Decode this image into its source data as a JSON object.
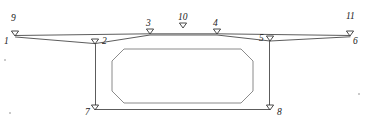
{
  "figure": {
    "type": "line-diagram",
    "title": "",
    "background_color": "#ffffff",
    "line_color": "#4a4a4a",
    "label_color": "#1a1a1a",
    "marker_shape": "down-triangle-outline",
    "width": 366,
    "height": 126
  },
  "nodes": [
    {
      "id": "1",
      "label": "1",
      "x": 15,
      "y": 36,
      "marker": true,
      "label_x": 4,
      "label_y": 37
    },
    {
      "id": "2",
      "label": "2",
      "x": 95,
      "y": 44,
      "marker": true,
      "label_x": 102,
      "label_y": 37
    },
    {
      "id": "3",
      "label": "3",
      "x": 150,
      "y": 34,
      "marker": true,
      "label_x": 146,
      "label_y": 19
    },
    {
      "id": "4",
      "label": "4",
      "x": 217,
      "y": 34,
      "marker": true,
      "label_x": 213,
      "label_y": 19
    },
    {
      "id": "5",
      "label": "5",
      "x": 270,
      "y": 41,
      "marker": true,
      "label_x": 259,
      "label_y": 34
    },
    {
      "id": "6",
      "label": "6",
      "x": 350,
      "y": 36,
      "marker": true,
      "label_x": 353,
      "label_y": 37
    },
    {
      "id": "7",
      "label": "7",
      "x": 95,
      "y": 110,
      "marker": true,
      "label_x": 85,
      "label_y": 108
    },
    {
      "id": "8",
      "label": "8",
      "x": 270,
      "y": 110,
      "marker": true,
      "label_x": 277,
      "label_y": 108
    },
    {
      "id": "9",
      "label": "9",
      "x": 15,
      "y": 32,
      "marker": false,
      "label_x": 11,
      "label_y": 14
    },
    {
      "id": "10",
      "label": "10",
      "x": 183,
      "y": 28,
      "marker": true,
      "label_x": 178,
      "label_y": 13
    },
    {
      "id": "11",
      "label": "11",
      "x": 350,
      "y": 32,
      "marker": false,
      "label_x": 346,
      "label_y": 12
    }
  ],
  "edges": [
    {
      "name": "top-chord-left",
      "from": "1",
      "to": "3"
    },
    {
      "name": "top-chord-mid",
      "from": "3",
      "to": "4"
    },
    {
      "name": "top-chord-right",
      "from": "4",
      "to": "6"
    },
    {
      "name": "lower-left-splay",
      "from": "1",
      "to": "2"
    },
    {
      "name": "lower-mid-chord",
      "from": "2",
      "to": "5"
    },
    {
      "name": "lower-right-splay",
      "from": "5",
      "to": "6"
    },
    {
      "name": "web-left",
      "from": "2",
      "to": "7"
    },
    {
      "name": "web-right",
      "from": "5",
      "to": "8"
    },
    {
      "name": "bottom-chord",
      "from": "7",
      "to": "8"
    }
  ],
  "inner_panel": {
    "name": "inner-rounded-octagon",
    "left": 112,
    "right": 253,
    "top": 49,
    "bottom": 103,
    "corner": 12
  },
  "paths": {
    "top_chord": "M 15.5,35.5 L 150,33.8 L 217,33.8 L 350,35.5",
    "lower_left": "M 15.5,37.0 L 95,43.6",
    "lower_mid": "M 95,43.6 L 150,35.0 L 217,35.0 L 270,41.0",
    "lower_right": "M 270,41.0 L 350,36.8",
    "web_left": "M 95.5,44.5 L 95.5,109.5",
    "web_right": "M 269.5,41.5 L 269.5,109.5",
    "bottom_chord": "M 95.5,109.5 L 269.5,109.5",
    "inner_panel": "M 124,49 L 241,49 L 253,61 L 253,91 L 241,103 L 124,103 L 112,91 L 112,61 Z"
  },
  "specks": [
    {
      "x": 4,
      "y": 59,
      "d": 2
    },
    {
      "x": 9,
      "y": 112,
      "d": 2
    },
    {
      "x": 358,
      "y": 93,
      "d": 2
    }
  ]
}
